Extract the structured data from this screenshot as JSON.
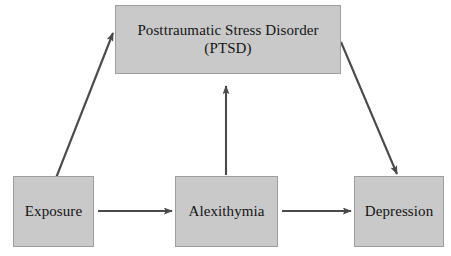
{
  "diagram": {
    "style": {
      "box_fill": "#c9c9c9",
      "box_border": "#9e9e9e",
      "arrow_color": "#4a4a4a",
      "text_color": "#141414",
      "background": "#ffffff"
    },
    "nodes": [
      {
        "id": "ptsd",
        "label": "Posttraumatic Stress Disorder\n(PTSD)",
        "line1": "Posttraumatic Stress Disorder",
        "line2": "(PTSD)"
      },
      {
        "id": "exposure",
        "label": "Exposure"
      },
      {
        "id": "alexithymia",
        "label": "Alexithymia"
      },
      {
        "id": "depression",
        "label": "Depression"
      }
    ],
    "edges": [
      {
        "id": "exposure-to-ptsd",
        "from": "Exposure",
        "to": "Posttraumatic Stress Disorder (PTSD)",
        "direction": "diagonal-up-right"
      },
      {
        "id": "exposure-to-alexithymia",
        "from": "Exposure",
        "to": "Alexithymia",
        "direction": "right"
      },
      {
        "id": "alexithymia-to-ptsd",
        "from": "Alexithymia",
        "to": "Posttraumatic Stress Disorder (PTSD)",
        "direction": "up"
      },
      {
        "id": "alexithymia-to-depression",
        "from": "Alexithymia",
        "to": "Depression",
        "direction": "right"
      },
      {
        "id": "ptsd-to-depression",
        "from": "Posttraumatic Stress Disorder (PTSD)",
        "to": "Depression",
        "direction": "diagonal-down-right"
      }
    ]
  }
}
